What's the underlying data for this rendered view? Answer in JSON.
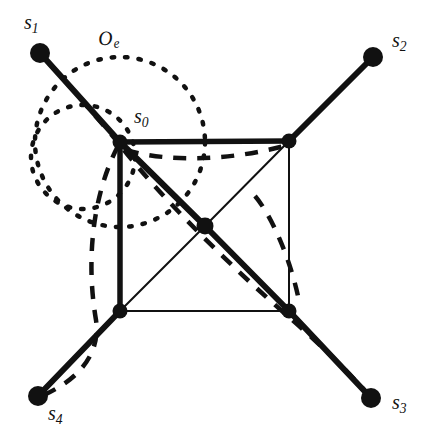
{
  "figure": {
    "width": 446,
    "height": 445,
    "background_color": "#ffffff",
    "stroke_color": "#111111",
    "labels": {
      "s0": {
        "base": "s",
        "sub": "0",
        "text": "s0",
        "x": 134,
        "y": 106
      },
      "s1": {
        "base": "s",
        "sub": "1",
        "text": "s1",
        "x": 24,
        "y": 12
      },
      "s2": {
        "base": "s",
        "sub": "2",
        "text": "s2",
        "x": 392,
        "y": 30
      },
      "s3": {
        "base": "s",
        "sub": "3",
        "text": "s3",
        "x": 392,
        "y": 392
      },
      "s4": {
        "base": "s",
        "sub": "4",
        "text": "s4",
        "x": 48,
        "y": 403
      },
      "Oe": {
        "base": "O",
        "sub": "e",
        "text": "Oe",
        "x": 97,
        "y": 29
      }
    },
    "vertices": [
      {
        "name": "s0",
        "x": 120,
        "y": 142,
        "r": 7.5,
        "kind": "square-corner-top-left"
      },
      {
        "name": "top-right-corner",
        "x": 289,
        "y": 141,
        "r": 7.5,
        "kind": "square-corner-top-right"
      },
      {
        "name": "bottom-left-corner",
        "x": 120,
        "y": 311,
        "r": 7.5,
        "kind": "square-corner-bottom-left"
      },
      {
        "name": "bottom-right-corner",
        "x": 289,
        "y": 311,
        "r": 7.5,
        "kind": "square-corner-bottom-right"
      },
      {
        "name": "center",
        "x": 205,
        "y": 226,
        "r": 8.5,
        "kind": "center"
      },
      {
        "name": "s1",
        "x": 40,
        "y": 53,
        "r": 10,
        "kind": "pendant"
      },
      {
        "name": "s2",
        "x": 373,
        "y": 57,
        "r": 10,
        "kind": "pendant"
      },
      {
        "name": "s3",
        "x": 371,
        "y": 398,
        "r": 10,
        "kind": "pendant"
      },
      {
        "name": "s4",
        "x": 38,
        "y": 396,
        "r": 10,
        "kind": "pendant"
      }
    ],
    "thick_edges": [
      {
        "from": "s1",
        "to": "s0",
        "x1": 40,
        "y1": 53,
        "x2": 120,
        "y2": 142,
        "width": 6
      },
      {
        "from": "s2",
        "to": "top-right-corner",
        "x1": 373,
        "y1": 57,
        "x2": 289,
        "y2": 141,
        "width": 6
      },
      {
        "from": "s3",
        "to": "bottom-right-corner",
        "x1": 371,
        "y1": 398,
        "x2": 289,
        "y2": 311,
        "width": 6
      },
      {
        "from": "s4",
        "to": "bottom-left-corner",
        "x1": 38,
        "y1": 396,
        "x2": 120,
        "y2": 311,
        "width": 6
      },
      {
        "from": "s0",
        "to": "top-right-corner",
        "x1": 120,
        "y1": 142,
        "x2": 289,
        "y2": 141,
        "width": 5.5
      },
      {
        "from": "s0",
        "to": "bottom-left-corner",
        "x1": 120,
        "y1": 142,
        "x2": 120,
        "y2": 311,
        "width": 5.5
      },
      {
        "from": "s0",
        "to": "center",
        "x1": 120,
        "y1": 142,
        "x2": 205,
        "y2": 226,
        "width": 6
      },
      {
        "from": "center",
        "to": "bottom-right-corner",
        "x1": 205,
        "y1": 226,
        "x2": 289,
        "y2": 311,
        "width": 6
      }
    ],
    "thin_edges": [
      {
        "from": "top-right-corner",
        "to": "bottom-right-corner",
        "x1": 289,
        "y1": 141,
        "x2": 289,
        "y2": 311,
        "width": 2
      },
      {
        "from": "bottom-left-corner",
        "to": "bottom-right-corner",
        "x1": 120,
        "y1": 311,
        "x2": 289,
        "y2": 311,
        "width": 2
      },
      {
        "from": "top-right-corner",
        "to": "center",
        "x1": 289,
        "y1": 141,
        "x2": 205,
        "y2": 226,
        "width": 2
      },
      {
        "from": "bottom-left-corner",
        "to": "center",
        "x1": 120,
        "y1": 311,
        "x2": 205,
        "y2": 226,
        "width": 2
      }
    ],
    "dotted_circles": [
      {
        "name": "Oe-large",
        "cx": 120,
        "cy": 142,
        "r": 85,
        "dash": "2.5 11",
        "width": 4.5
      },
      {
        "name": "Oe-small",
        "cx": 83,
        "cy": 157,
        "r": 52,
        "dash": "2.5 11",
        "width": 4.5
      }
    ],
    "dashed_curves": [
      {
        "name": "dashed-arc-s1-to-s0",
        "path": "M 48 62 C 70 86 92 112 116 140",
        "dash": "13 11",
        "width": 4.5
      },
      {
        "name": "dashed-arc-top-edge",
        "path": "M 126 150 C 170 163 232 160 284 146",
        "dash": "13 11",
        "width": 4.5
      },
      {
        "name": "dashed-arc-left-loop",
        "path": "M 118 146 C 92 196 86 262 96 320 C 100 350 84 376 46 394",
        "dash": "13 11",
        "width": 4.5
      },
      {
        "name": "dashed-arc-diagonal",
        "path": "M 124 150 C 160 196 232 268 290 318 C 320 344 348 372 368 394",
        "dash": "13 11",
        "width": 4.5
      },
      {
        "name": "dashed-arc-inner-right",
        "path": "M 255 196 C 272 216 292 262 300 306",
        "dash": "13 11",
        "width": 4.5
      }
    ]
  }
}
